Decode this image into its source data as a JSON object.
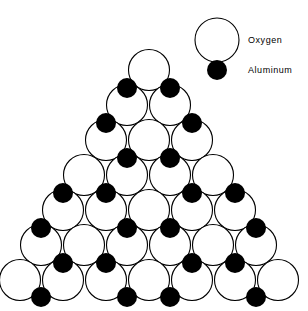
{
  "figure": {
    "background_color": "#ffffff",
    "width": 308,
    "height": 311
  },
  "legend": {
    "position": "top-right",
    "entries": [
      {
        "label": "Oxygen",
        "marker": "open-circle",
        "marker_icon_name": "oxygen-circle-icon",
        "fill_color": "#ffffff",
        "stroke_color": "#000000",
        "marker_cx": 217,
        "marker_cy": 40,
        "marker_r": 22,
        "label_x": 248,
        "label_y": 43
      },
      {
        "label": "Aluminum",
        "marker": "filled-circle",
        "marker_icon_name": "aluminum-dot-icon",
        "fill_color": "#000000",
        "stroke_color": "#000000",
        "marker_cx": 217,
        "marker_cy": 70,
        "marker_r": 10,
        "label_x": 248,
        "label_y": 73
      }
    ]
  },
  "chart_data": {
    "type": "scatter",
    "title": "",
    "xlabel": "",
    "ylabel": "",
    "grid": false,
    "legend_position": "top-right",
    "xlim": [
      0,
      308
    ],
    "ylim": [
      311,
      0
    ],
    "lattice": {
      "description": "Triangular (pyramidal) arrangement of close-packed oxygen spheres with aluminum ions in octahedral interstices",
      "rows": 7,
      "oxygen_radius": 20.5,
      "oxygen_count": 28,
      "aluminum_radius": 10,
      "aluminum_count": 24,
      "horizontal_spacing": 43,
      "vertical_spacing": 35,
      "row_y_centers": [
        70,
        105,
        140,
        175,
        210,
        245,
        280
      ],
      "row_counts": [
        1,
        2,
        3,
        4,
        5,
        6,
        7
      ]
    },
    "series": [
      {
        "name": "Oxygen",
        "marker": "open-circle",
        "color": "#ffffff",
        "edge_color": "#000000",
        "radius": 20.5,
        "points": [
          {
            "x": 149,
            "y": 70
          },
          {
            "x": 127,
            "y": 105
          },
          {
            "x": 170,
            "y": 105
          },
          {
            "x": 106,
            "y": 140
          },
          {
            "x": 149,
            "y": 140
          },
          {
            "x": 192,
            "y": 140
          },
          {
            "x": 84,
            "y": 175
          },
          {
            "x": 127,
            "y": 175
          },
          {
            "x": 170,
            "y": 175
          },
          {
            "x": 213,
            "y": 175
          },
          {
            "x": 63,
            "y": 210
          },
          {
            "x": 106,
            "y": 210
          },
          {
            "x": 149,
            "y": 210
          },
          {
            "x": 192,
            "y": 210
          },
          {
            "x": 235,
            "y": 210
          },
          {
            "x": 41,
            "y": 245
          },
          {
            "x": 84,
            "y": 245
          },
          {
            "x": 127,
            "y": 245
          },
          {
            "x": 170,
            "y": 245
          },
          {
            "x": 213,
            "y": 245
          },
          {
            "x": 256,
            "y": 245
          },
          {
            "x": 20,
            "y": 280
          },
          {
            "x": 63,
            "y": 280
          },
          {
            "x": 106,
            "y": 280
          },
          {
            "x": 149,
            "y": 280
          },
          {
            "x": 192,
            "y": 280
          },
          {
            "x": 235,
            "y": 280
          },
          {
            "x": 278,
            "y": 280
          }
        ]
      },
      {
        "name": "Aluminum",
        "marker": "filled-circle",
        "color": "#000000",
        "radius": 10,
        "points": [
          {
            "x": 127,
            "y": 88
          },
          {
            "x": 170,
            "y": 88
          },
          {
            "x": 106,
            "y": 123
          },
          {
            "x": 192,
            "y": 123
          },
          {
            "x": 127,
            "y": 158
          },
          {
            "x": 170,
            "y": 158
          },
          {
            "x": 63,
            "y": 193
          },
          {
            "x": 106,
            "y": 193
          },
          {
            "x": 192,
            "y": 193
          },
          {
            "x": 235,
            "y": 193
          },
          {
            "x": 41,
            "y": 228
          },
          {
            "x": 127,
            "y": 228
          },
          {
            "x": 170,
            "y": 228
          },
          {
            "x": 256,
            "y": 228
          },
          {
            "x": 63,
            "y": 263
          },
          {
            "x": 106,
            "y": 263
          },
          {
            "x": 192,
            "y": 263
          },
          {
            "x": 235,
            "y": 263
          },
          {
            "x": 41,
            "y": 297
          },
          {
            "x": 127,
            "y": 297
          },
          {
            "x": 170,
            "y": 297
          },
          {
            "x": 256,
            "y": 297
          }
        ]
      }
    ]
  }
}
